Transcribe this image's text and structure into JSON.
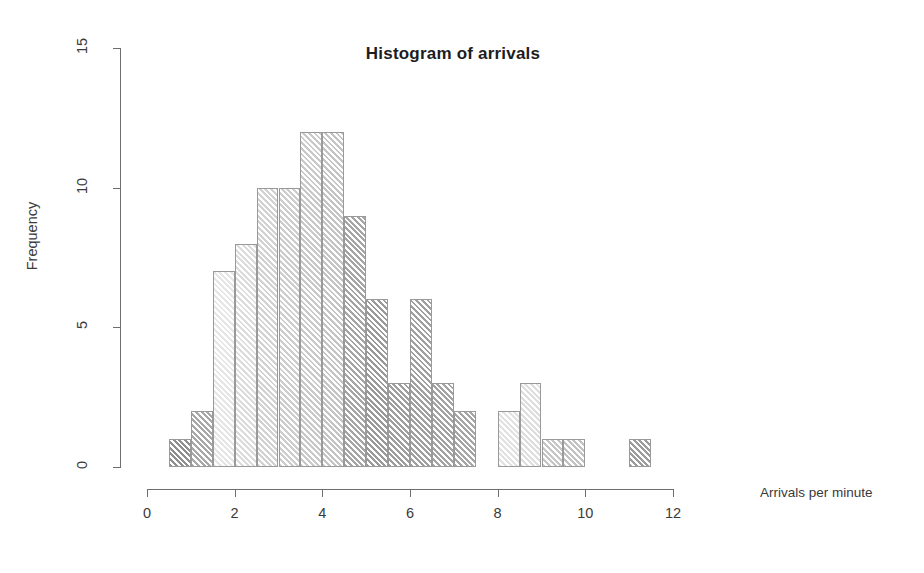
{
  "chart_data": {
    "type": "bar",
    "chart_subtype": "histogram",
    "title": "Histogram of arrivals",
    "xlabel": "Arrivals per minute",
    "ylabel": "Frequency",
    "xlim": [
      0,
      12
    ],
    "ylim": [
      0,
      15
    ],
    "xticks": [
      0,
      2,
      4,
      6,
      8,
      10,
      12
    ],
    "yticks": [
      0,
      5,
      10,
      15
    ],
    "grid": false,
    "legend": null,
    "bin_width": 0.5,
    "bin_edges": [
      0.5,
      1.0,
      1.5,
      2.0,
      2.5,
      3.0,
      3.5,
      4.0,
      4.5,
      5.0,
      5.5,
      6.0,
      6.5,
      7.0,
      7.5,
      8.0,
      8.5,
      9.0,
      9.5,
      10.0,
      10.5,
      11.0,
      11.5
    ],
    "categories": [
      "0.5-1.0",
      "1.0-1.5",
      "1.5-2.0",
      "2.0-2.5",
      "2.5-3.0",
      "3.0-3.5",
      "3.5-4.0",
      "4.0-4.5",
      "4.5-5.0",
      "5.0-5.5",
      "5.5-6.0",
      "6.0-6.5",
      "6.5-7.0",
      "7.0-7.5",
      "7.5-8.0",
      "8.0-8.5",
      "8.5-9.0",
      "9.0-9.5",
      "9.5-10.0",
      "10.0-10.5",
      "10.5-11.0",
      "11.0-11.5"
    ],
    "values": [
      1,
      2,
      7,
      8,
      10,
      10,
      12,
      12,
      9,
      6,
      3,
      6,
      3,
      2,
      0,
      2,
      3,
      1,
      1,
      0,
      0,
      1
    ],
    "bars": [
      {
        "x0": 0.5,
        "x1": 1.0,
        "frequency": 1,
        "shade": "#8f8f8f"
      },
      {
        "x0": 1.0,
        "x1": 1.5,
        "frequency": 2,
        "shade": "#a8a8a8"
      },
      {
        "x0": 1.5,
        "x1": 2.0,
        "frequency": 7,
        "shade": "#e6e6e6"
      },
      {
        "x0": 2.0,
        "x1": 2.5,
        "frequency": 8,
        "shade": "#dcdcdc"
      },
      {
        "x0": 2.5,
        "x1": 3.0,
        "frequency": 10,
        "shade": "#d2d2d2"
      },
      {
        "x0": 3.0,
        "x1": 3.5,
        "frequency": 10,
        "shade": "#cdcdcd"
      },
      {
        "x0": 3.5,
        "x1": 4.0,
        "frequency": 12,
        "shade": "#c9c9c9"
      },
      {
        "x0": 4.0,
        "x1": 4.5,
        "frequency": 12,
        "shade": "#c4c4c4"
      },
      {
        "x0": 4.5,
        "x1": 5.0,
        "frequency": 9,
        "shade": "#a5a5a5"
      },
      {
        "x0": 5.0,
        "x1": 5.5,
        "frequency": 6,
        "shade": "#9a9a9a"
      },
      {
        "x0": 5.5,
        "x1": 6.0,
        "frequency": 3,
        "shade": "#9e9e9e"
      },
      {
        "x0": 6.0,
        "x1": 6.5,
        "frequency": 6,
        "shade": "#a0a0a0"
      },
      {
        "x0": 6.5,
        "x1": 7.0,
        "frequency": 3,
        "shade": "#a3a3a3"
      },
      {
        "x0": 7.0,
        "x1": 7.5,
        "frequency": 2,
        "shade": "#a6a6a6"
      },
      {
        "x0": 7.5,
        "x1": 8.0,
        "frequency": 0,
        "shade": "#ffffff"
      },
      {
        "x0": 8.0,
        "x1": 8.5,
        "frequency": 2,
        "shade": "#e2e2e2"
      },
      {
        "x0": 8.5,
        "x1": 9.0,
        "frequency": 3,
        "shade": "#dedede"
      },
      {
        "x0": 9.0,
        "x1": 9.5,
        "frequency": 1,
        "shade": "#c6c6c6"
      },
      {
        "x0": 9.5,
        "x1": 10.0,
        "frequency": 1,
        "shade": "#c2c2c2"
      },
      {
        "x0": 10.0,
        "x1": 10.5,
        "frequency": 0,
        "shade": "#ffffff"
      },
      {
        "x0": 10.5,
        "x1": 11.0,
        "frequency": 0,
        "shade": "#ffffff"
      },
      {
        "x0": 11.0,
        "x1": 11.5,
        "frequency": 1,
        "shade": "#9c9c9c"
      }
    ]
  },
  "axes": {
    "x_tick_labels": [
      "0",
      "2",
      "4",
      "6",
      "8",
      "10",
      "12"
    ],
    "y_tick_labels": [
      "0",
      "5",
      "10",
      "15"
    ]
  },
  "colors": {
    "axis": "#6e6e6e",
    "text": "#3a3a3a",
    "title": "#1d1d1d",
    "bar_border": "#9a9a9a",
    "background": "#ffffff"
  }
}
